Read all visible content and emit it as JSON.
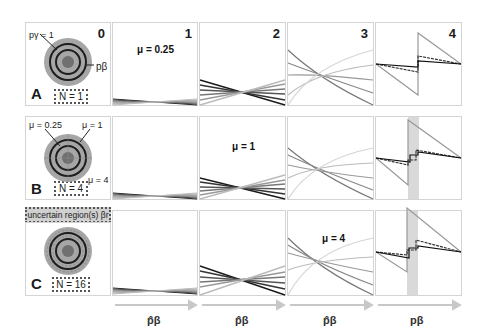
{
  "rows": [
    {
      "label": "A",
      "n_label": "N = 1",
      "mu_label": "μ = 0.25",
      "mu_col": 1
    },
    {
      "label": "B",
      "n_label": "N = 4",
      "mu_label": "μ = 1",
      "mu_col": 2
    },
    {
      "label": "C",
      "n_label": "N = 16",
      "mu_label": "μ = 4",
      "mu_col": 3
    }
  ],
  "columns": [
    "0",
    "1",
    "2",
    "3",
    "4"
  ],
  "annotations": {
    "p_gamma": "pγ = 1",
    "p_beta": "pβ",
    "mu_025": "μ = 0.25",
    "mu_1": "μ = 1",
    "mu_4": "μ = 4",
    "uncertain": "uncertain region(s) βr"
  },
  "axes": {
    "col1": "p̂β",
    "col2": "p̂β",
    "col3": "p̂β",
    "col4": "pβ"
  },
  "colors": {
    "dark": "#222222",
    "mid": "#808080",
    "light": "#bdbdbd",
    "ring_fill": "#a6a6a6",
    "band": "#d9d9d9",
    "arrow": "#c8c8c8"
  }
}
